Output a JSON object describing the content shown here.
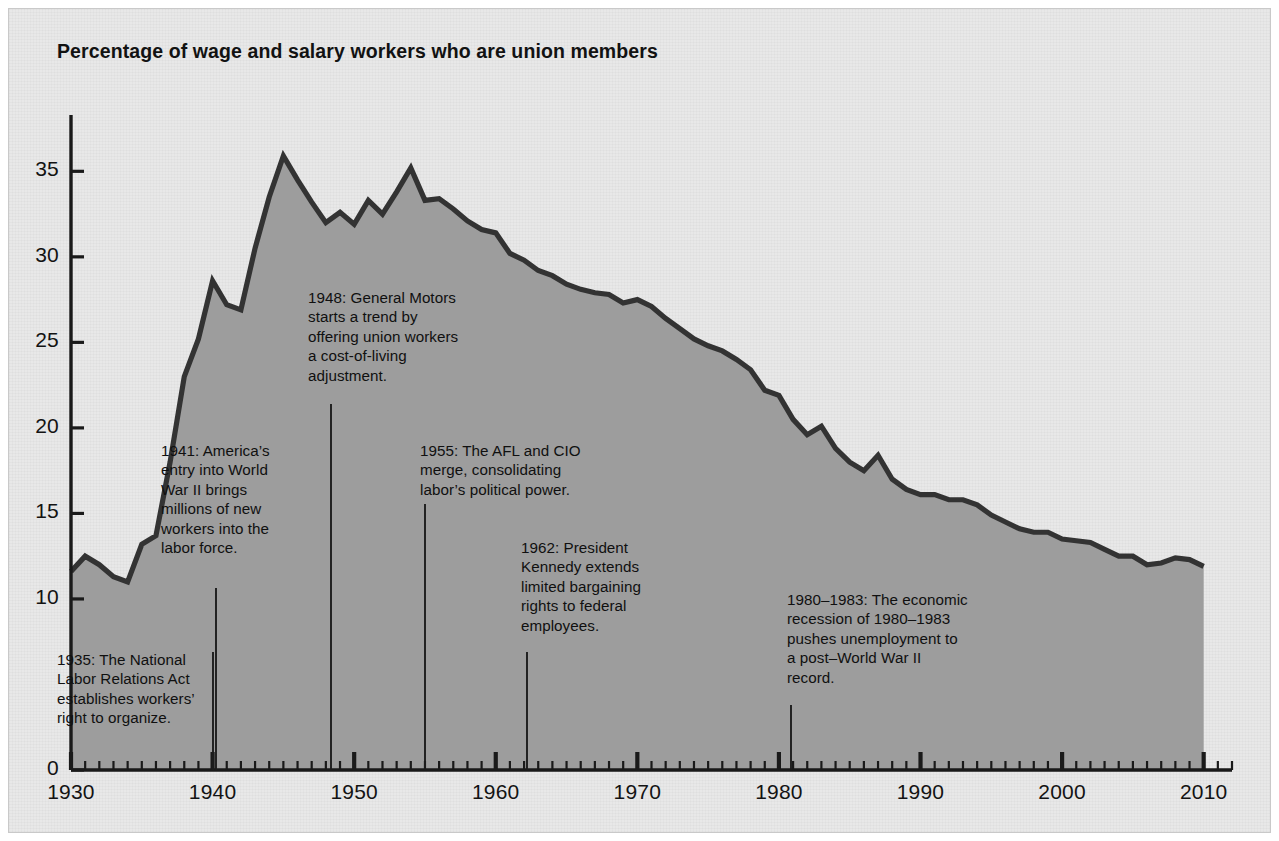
{
  "title": "Percentage of wage and salary workers who are union members",
  "colors": {
    "panel_background": "#e8e8e8",
    "area_fill": "#9d9d9d",
    "line": "#333333",
    "axis": "#1a1a1a",
    "text": "#111111"
  },
  "axes": {
    "x": {
      "label": "",
      "min": 1930,
      "max": 2012,
      "tick_labels": [
        "1930",
        "1940",
        "1950",
        "1960",
        "1970",
        "1980",
        "1990",
        "2000",
        "2010"
      ],
      "major_tick_interval": 10,
      "minor_tick_interval": 1
    },
    "y": {
      "label": "",
      "min": 0,
      "max": 38,
      "tick_labels": [
        "0",
        "10",
        "15",
        "20",
        "25",
        "30",
        "35"
      ],
      "tick_values": [
        0,
        10,
        15,
        20,
        25,
        30,
        35
      ]
    }
  },
  "annotations": [
    {
      "id": "1935",
      "year": 1935,
      "text": "1935: The National\nLabor Relations Act\nestablishes workers’\nright to organize.",
      "x": 57,
      "y": 650,
      "leader_x": 213,
      "leader_top": 652
    },
    {
      "id": "1941",
      "year": 1941,
      "text": "1941: America’s\nentry into World\nWar II brings\nmillions of new\nworkers into the\nlabor force.",
      "x": 161,
      "y": 441,
      "leader_x": 216,
      "leader_top": 588
    },
    {
      "id": "1948",
      "year": 1948,
      "text": "1948: General Motors\nstarts a trend by\noffering union workers\na cost-of-living\nadjustment.",
      "x": 308,
      "y": 288,
      "leader_x": 331,
      "leader_top": 404
    },
    {
      "id": "1955",
      "year": 1955,
      "text": "1955: The AFL and CIO\nmerge, consolidating\nlabor’s political power.",
      "x": 420,
      "y": 441,
      "leader_x": 425,
      "leader_top": 504
    },
    {
      "id": "1962",
      "year": 1962,
      "text": "1962: President\nKennedy extends\nlimited bargaining\nrights to federal\nemployees.",
      "x": 521,
      "y": 538,
      "leader_x": 527,
      "leader_top": 652
    },
    {
      "id": "1980-1983",
      "year": 1980,
      "text": "1980–1983: The economic\nrecession of 1980–1983\npushes unemployment to\na post–World War II\nrecord.",
      "x": 787,
      "y": 590,
      "leader_x": 791,
      "leader_top": 705
    }
  ],
  "chart_data": {
    "type": "area",
    "title": "Percentage of wage and salary workers who are union members",
    "xlabel": "",
    "ylabel": "",
    "xlim": [
      1930,
      2012
    ],
    "ylim": [
      0,
      38
    ],
    "grid": false,
    "legend": "none",
    "x": [
      1930,
      1931,
      1932,
      1933,
      1934,
      1935,
      1936,
      1937,
      1938,
      1939,
      1940,
      1941,
      1942,
      1943,
      1944,
      1945,
      1946,
      1947,
      1948,
      1949,
      1950,
      1951,
      1952,
      1953,
      1954,
      1955,
      1956,
      1957,
      1958,
      1959,
      1960,
      1961,
      1962,
      1963,
      1964,
      1965,
      1966,
      1967,
      1968,
      1969,
      1970,
      1971,
      1972,
      1973,
      1974,
      1975,
      1976,
      1977,
      1978,
      1979,
      1980,
      1981,
      1982,
      1983,
      1984,
      1985,
      1986,
      1987,
      1988,
      1989,
      1990,
      1991,
      1992,
      1993,
      1994,
      1995,
      1996,
      1997,
      1998,
      1999,
      2000,
      2001,
      2002,
      2003,
      2004,
      2005,
      2006,
      2007,
      2008,
      2009,
      2010
    ],
    "values": [
      11.6,
      12.5,
      12.0,
      11.3,
      11.0,
      13.2,
      13.7,
      18.0,
      23.0,
      25.2,
      28.6,
      27.2,
      26.9,
      30.5,
      33.5,
      35.9,
      34.5,
      33.2,
      32.0,
      32.6,
      31.9,
      33.3,
      32.5,
      33.8,
      35.2,
      33.3,
      33.4,
      32.8,
      32.1,
      31.6,
      31.4,
      30.2,
      29.8,
      29.2,
      28.9,
      28.4,
      28.1,
      27.9,
      27.8,
      27.3,
      27.5,
      27.1,
      26.4,
      25.8,
      25.2,
      24.8,
      24.5,
      24.0,
      23.4,
      22.2,
      21.9,
      20.5,
      19.6,
      20.1,
      18.8,
      18.0,
      17.5,
      18.4,
      17.0,
      16.4,
      16.1,
      16.1,
      15.8,
      15.8,
      15.5,
      14.9,
      14.5,
      14.1,
      13.9,
      13.9,
      13.5,
      13.4,
      13.3,
      12.9,
      12.5,
      12.5,
      12.0,
      12.1,
      12.4,
      12.3,
      11.9
    ],
    "annotation_notes": [
      "1935: The National Labor Relations Act establishes workers’ right to organize.",
      "1941: America’s entry into World War II brings millions of new workers into the labor force.",
      "1948: General Motors starts a trend by offering union workers a cost-of-living adjustment.",
      "1955: The AFL and CIO merge, consolidating labor’s political power.",
      "1962: President Kennedy extends limited bargaining rights to federal employees.",
      "1980–1983: The economic recession of 1980–1983 pushes unemployment to a post–World War II record."
    ]
  }
}
